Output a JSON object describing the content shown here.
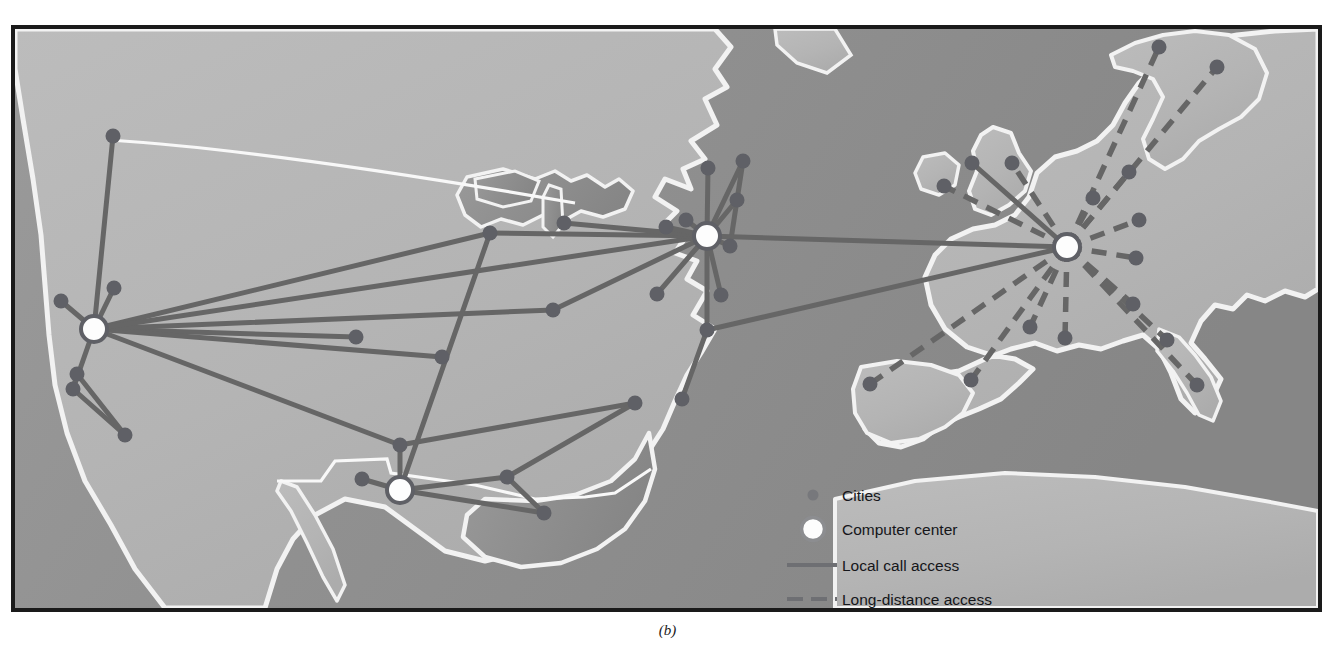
{
  "figure": {
    "caption": "(b)"
  },
  "colors": {
    "ocean": "#8e8e8e",
    "land": "#b6b6b6",
    "coastline": "#f2f2f2",
    "link": "#666666",
    "city_node": "#5f6066",
    "hub_fill": "#fdfdfd",
    "hub_ring": "#5f6066",
    "frame": "#1a1a1a",
    "text": "#15161a",
    "page_background": "#ffffff"
  },
  "legend": {
    "name": "map-legend",
    "items": [
      {
        "symbol": "small-dot",
        "label": "Cities"
      },
      {
        "symbol": "large-ring-dot",
        "label": "Computer center"
      },
      {
        "symbol": "solid-line",
        "label": "Local call access"
      },
      {
        "symbol": "dashed-line",
        "label": "Long-distance access"
      }
    ]
  },
  "map": {
    "name": "network-map",
    "hubs": [
      {
        "id": "hub-west",
        "x": 87,
        "y": 329
      },
      {
        "id": "hub-south",
        "x": 393,
        "y": 490
      },
      {
        "id": "hub-northeast",
        "x": 700,
        "y": 236
      },
      {
        "id": "hub-europe",
        "x": 1060,
        "y": 247
      }
    ],
    "cities": [
      {
        "id": "c-seattle",
        "x": 106,
        "y": 136
      },
      {
        "id": "c-portland",
        "x": 54,
        "y": 301
      },
      {
        "id": "c-sacramento",
        "x": 107,
        "y": 288
      },
      {
        "id": "c-fresno",
        "x": 70,
        "y": 374
      },
      {
        "id": "c-losangeles",
        "x": 118,
        "y": 435
      },
      {
        "id": "c-sandiego",
        "x": 66,
        "y": 389
      },
      {
        "id": "c-denver",
        "x": 349,
        "y": 337
      },
      {
        "id": "c-wichita",
        "x": 435,
        "y": 357
      },
      {
        "id": "c-okc",
        "x": 393,
        "y": 445
      },
      {
        "id": "c-amarillo",
        "x": 355,
        "y": 479
      },
      {
        "id": "c-houston",
        "x": 500,
        "y": 477
      },
      {
        "id": "c-neworleans",
        "x": 537,
        "y": 513
      },
      {
        "id": "c-stlouis",
        "x": 546,
        "y": 310
      },
      {
        "id": "c-minneapolis",
        "x": 483,
        "y": 233
      },
      {
        "id": "c-chicago",
        "x": 557,
        "y": 223
      },
      {
        "id": "c-indianapolis",
        "x": 650,
        "y": 294
      },
      {
        "id": "c-cleveland",
        "x": 659,
        "y": 227
      },
      {
        "id": "c-buffalo",
        "x": 679,
        "y": 220
      },
      {
        "id": "c-albany",
        "x": 701,
        "y": 168
      },
      {
        "id": "c-boston",
        "x": 736,
        "y": 161
      },
      {
        "id": "c-hartford",
        "x": 730,
        "y": 200
      },
      {
        "id": "c-newyork",
        "x": 723,
        "y": 246
      },
      {
        "id": "c-philadelphia",
        "x": 714,
        "y": 295
      },
      {
        "id": "c-baltimore",
        "x": 700,
        "y": 330
      },
      {
        "id": "c-richmond",
        "x": 675,
        "y": 399
      },
      {
        "id": "c-atlanta",
        "x": 628,
        "y": 403
      },
      {
        "id": "c-london",
        "x": 965,
        "y": 163
      },
      {
        "id": "c-dublin",
        "x": 937,
        "y": 186
      },
      {
        "id": "c-manchester",
        "x": 1005,
        "y": 163
      },
      {
        "id": "c-oslo",
        "x": 1152,
        "y": 47
      },
      {
        "id": "c-stockholm",
        "x": 1210,
        "y": 67
      },
      {
        "id": "c-copenhagen",
        "x": 1122,
        "y": 172
      },
      {
        "id": "c-amsterdam",
        "x": 1086,
        "y": 198
      },
      {
        "id": "c-berlin",
        "x": 1132,
        "y": 220
      },
      {
        "id": "c-vienna",
        "x": 1129,
        "y": 258
      },
      {
        "id": "c-munich",
        "x": 1126,
        "y": 304
      },
      {
        "id": "c-paris",
        "x": 1058,
        "y": 338
      },
      {
        "id": "c-lyon",
        "x": 1023,
        "y": 327
      },
      {
        "id": "c-bordeaux",
        "x": 964,
        "y": 380
      },
      {
        "id": "c-madrid",
        "x": 863,
        "y": 384
      },
      {
        "id": "c-rome",
        "x": 1190,
        "y": 385
      },
      {
        "id": "c-milan",
        "x": 1160,
        "y": 340
      }
    ],
    "links_local": [
      [
        "hub-west",
        "c-seattle"
      ],
      [
        "hub-west",
        "c-portland"
      ],
      [
        "hub-west",
        "c-sacramento"
      ],
      [
        "hub-west",
        "c-sandiego"
      ],
      [
        "hub-west",
        "c-denver"
      ],
      [
        "hub-west",
        "c-wichita"
      ],
      [
        "hub-west",
        "c-stlouis"
      ],
      [
        "hub-west",
        "c-minneapolis"
      ],
      [
        "hub-west",
        "c-hub-northeast"
      ],
      [
        "hub-west",
        "c-okc"
      ],
      [
        "c-sandiego",
        "c-losangeles"
      ],
      [
        "c-sandiego",
        "c-fresno"
      ],
      [
        "c-fresno",
        "c-losangeles"
      ],
      [
        "hub-south",
        "c-amarillo"
      ],
      [
        "hub-south",
        "c-okc"
      ],
      [
        "hub-south",
        "c-houston"
      ],
      [
        "hub-south",
        "c-neworleans"
      ],
      [
        "hub-south",
        "c-minneapolis"
      ],
      [
        "c-okc",
        "c-atlanta"
      ],
      [
        "c-houston",
        "c-atlanta"
      ],
      [
        "c-houston",
        "c-neworleans"
      ],
      [
        "hub-northeast",
        "c-minneapolis"
      ],
      [
        "hub-northeast",
        "c-chicago"
      ],
      [
        "hub-northeast",
        "c-stlouis"
      ],
      [
        "hub-northeast",
        "c-indianapolis"
      ],
      [
        "hub-northeast",
        "c-cleveland"
      ],
      [
        "hub-northeast",
        "c-buffalo"
      ],
      [
        "hub-northeast",
        "c-albany"
      ],
      [
        "hub-northeast",
        "c-boston"
      ],
      [
        "hub-northeast",
        "c-hartford"
      ],
      [
        "hub-northeast",
        "c-newyork"
      ],
      [
        "hub-northeast",
        "c-philadelphia"
      ],
      [
        "hub-northeast",
        "c-baltimore"
      ],
      [
        "c-boston",
        "c-hartford"
      ],
      [
        "c-hartford",
        "c-newyork"
      ],
      [
        "c-baltimore",
        "c-richmond"
      ],
      [
        "hub-northeast",
        "hub-europe"
      ],
      [
        "c-baltimore",
        "hub-europe"
      ],
      [
        "hub-europe",
        "c-london"
      ]
    ],
    "links_longdistance": [
      [
        "hub-europe",
        "c-dublin"
      ],
      [
        "hub-europe",
        "c-manchester"
      ],
      [
        "hub-europe",
        "c-oslo"
      ],
      [
        "hub-europe",
        "c-stockholm"
      ],
      [
        "hub-europe",
        "c-copenhagen"
      ],
      [
        "hub-europe",
        "c-amsterdam"
      ],
      [
        "hub-europe",
        "c-berlin"
      ],
      [
        "hub-europe",
        "c-vienna"
      ],
      [
        "hub-europe",
        "c-munich"
      ],
      [
        "hub-europe",
        "c-paris"
      ],
      [
        "hub-europe",
        "c-lyon"
      ],
      [
        "hub-europe",
        "c-bordeaux"
      ],
      [
        "hub-europe",
        "c-madrid"
      ],
      [
        "hub-europe",
        "c-milan"
      ],
      [
        "hub-europe",
        "c-rome"
      ]
    ]
  }
}
